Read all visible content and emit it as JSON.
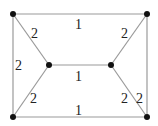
{
  "graph": {
    "nodes": [
      {
        "id": "tl",
        "x": 13,
        "y": 14
      },
      {
        "id": "tr",
        "x": 147,
        "y": 14
      },
      {
        "id": "bl",
        "x": 13,
        "y": 117
      },
      {
        "id": "br",
        "x": 147,
        "y": 117
      },
      {
        "id": "ml",
        "x": 49,
        "y": 65
      },
      {
        "id": "mr",
        "x": 111,
        "y": 65
      }
    ],
    "edges": [
      {
        "from": "tl",
        "to": "tr",
        "weight": "1"
      },
      {
        "from": "tl",
        "to": "ml",
        "weight": "2"
      },
      {
        "from": "tl",
        "to": "bl",
        "weight": "2"
      },
      {
        "from": "ml",
        "to": "mr",
        "weight": "1"
      },
      {
        "from": "tr",
        "to": "mr",
        "weight": "2"
      },
      {
        "from": "bl",
        "to": "ml",
        "weight": "2"
      },
      {
        "from": "mr",
        "to": "br",
        "weight": "2"
      },
      {
        "from": "tr",
        "to": "br",
        "weight": "2"
      },
      {
        "from": "bl",
        "to": "br",
        "weight": "1"
      }
    ]
  }
}
